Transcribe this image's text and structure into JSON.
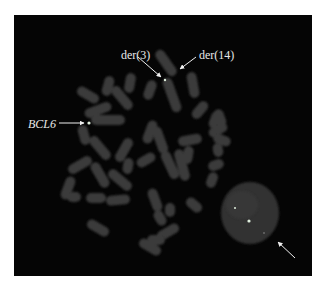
{
  "figure": {
    "type": "FISH metaphase spread",
    "background_color": "#050505",
    "chromosome_color": "#3a3a3a",
    "signal_color": "#d8e8d8",
    "labels": {
      "bcl6": "BCL6",
      "der3": "der(3)",
      "der14": "der(14)"
    },
    "arrows": [
      {
        "target": "BCL6 signal",
        "from": [
          58,
          123
        ],
        "to": [
          86,
          123
        ]
      },
      {
        "target": "der(3) signal",
        "from": [
          136,
          58
        ],
        "to": [
          162,
          78
        ]
      },
      {
        "target": "der(14) signal",
        "from": [
          196,
          58
        ],
        "to": [
          180,
          70
        ]
      },
      {
        "target": "interphase nucleus",
        "from": [
          296,
          258
        ],
        "to": [
          282,
          245
        ]
      }
    ]
  }
}
